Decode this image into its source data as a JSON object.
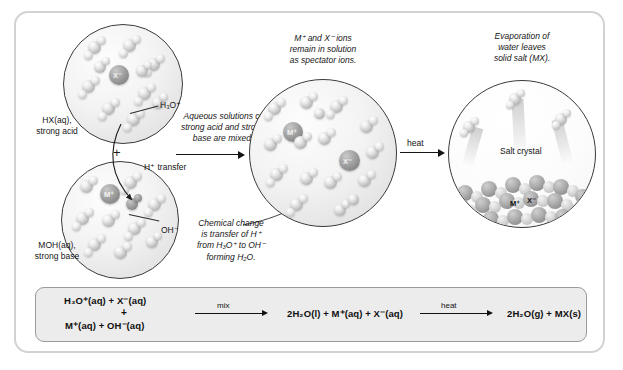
{
  "figure": {
    "frame_color": "#d2d2d2",
    "background_color": "#ffffff"
  },
  "bubbles": {
    "acid": {
      "name": "HX(aq) strong acid solution",
      "caption_line1": "HX(aq),",
      "caption_line2": "strong acid",
      "ion_label": "X⁻",
      "callout_label": "H₃O⁺"
    },
    "base": {
      "name": "MOH(aq) strong base solution",
      "caption_line1": "MOH(aq),",
      "caption_line2": "strong base",
      "ion_label": "M⁺",
      "callout_label": "OH⁻"
    },
    "mixed": {
      "name": "Mixed solution",
      "ion_label_cation": "M⁺",
      "ion_label_anion": "X⁻"
    },
    "salt": {
      "name": "Evaporating dish with salt crystal",
      "crystal_label": "Salt crystal",
      "ion_label_cation": "M⁺",
      "ion_label_anion": "X⁻"
    }
  },
  "annotations": {
    "plus_between_acid_base": "+",
    "h_transfer": "H⁺ transfer",
    "mix_caption": {
      "line1": "Aqueous solutions of",
      "line2": "strong acid and strong",
      "line3": "base are mixed."
    },
    "spectator_caption": {
      "line1": "M⁺ and X⁻ ions",
      "line2": "remain in solution",
      "line3": "as spectator ions."
    },
    "chemical_change_caption": {
      "line1": "Chemical change",
      "line2": "is transfer of H⁺",
      "line3": "from H₃O⁺ to OH⁻",
      "line4": "forming H₂O."
    },
    "evaporation_caption": {
      "line1": "Evaporation of",
      "line2": "water leaves",
      "line3": "solid salt (MX)."
    },
    "heat_arrow_label": "heat"
  },
  "equation": {
    "background_color": "#ececec",
    "border_color": "#9a9a9a",
    "reactants_line1": "H₃O⁺(aq) + X⁻(aq)",
    "reactants_plus": "+",
    "reactants_line2": "M⁺(aq) + OH⁻(aq)",
    "arrow1_label": "mix",
    "intermediate": "2H₂O(l) + M⁺(aq) + X⁻(aq)",
    "arrow2_label": "heat",
    "products": "2H₂O(g) + MX(s)"
  }
}
